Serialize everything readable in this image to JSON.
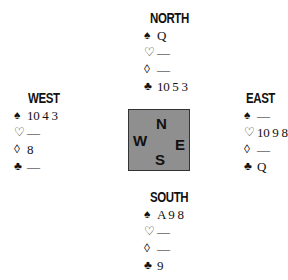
{
  "suit_symbols": {
    "spades": "♠",
    "hearts": "♡",
    "diamonds": "◊",
    "clubs": "♣"
  },
  "hands": {
    "north": {
      "label": "NORTH",
      "spades": "Q",
      "hearts": "—",
      "diamonds": "—",
      "clubs": "10 5 3"
    },
    "west": {
      "label": "WEST",
      "spades": "10 4 3",
      "hearts": "—",
      "diamonds": "8",
      "clubs": "—"
    },
    "east": {
      "label": "EAST",
      "spades": "—",
      "hearts": "10 9 8",
      "diamonds": "—",
      "clubs": "Q"
    },
    "south": {
      "label": "SOUTH",
      "spades": "A 9 8",
      "hearts": "—",
      "diamonds": "—",
      "clubs": "9"
    }
  },
  "compass": {
    "n": "N",
    "w": "W",
    "e": "E",
    "s": "S",
    "fill_color": "#8f8f8f"
  }
}
